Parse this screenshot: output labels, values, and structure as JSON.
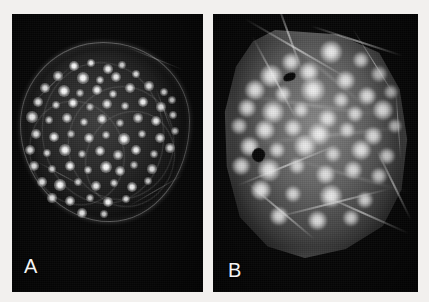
{
  "figure": {
    "kind": "fluorescence-micrograph-pair",
    "width": 429,
    "height": 302,
    "background_color": "#f2f0ee"
  },
  "panels": [
    {
      "id": "a",
      "label": "A",
      "label_color": "#f4f4f4",
      "background_color": "#070707",
      "description": "Dark-field fluorescence micrograph of a rounded cell showing numerous small, sharply defined bright punctate foci distributed across a faintly outlined circular cell body.",
      "cell_shape": "round",
      "focus_style": "small sharp puncta",
      "spot_count": 74,
      "spots": [
        {
          "x": 62,
          "y": 52,
          "r": 2.6,
          "i": 1.0
        },
        {
          "x": 79,
          "y": 49,
          "r": 2.2,
          "i": 0.92
        },
        {
          "x": 96,
          "y": 55,
          "r": 2.4,
          "i": 0.95
        },
        {
          "x": 110,
          "y": 51,
          "r": 2.0,
          "i": 0.8
        },
        {
          "x": 46,
          "y": 62,
          "r": 2.3,
          "i": 0.88
        },
        {
          "x": 71,
          "y": 64,
          "r": 2.8,
          "i": 1.0
        },
        {
          "x": 88,
          "y": 66,
          "r": 2.1,
          "i": 0.84
        },
        {
          "x": 104,
          "y": 63,
          "r": 2.5,
          "i": 0.93
        },
        {
          "x": 124,
          "y": 60,
          "r": 2.2,
          "i": 0.86
        },
        {
          "x": 33,
          "y": 74,
          "r": 2.4,
          "i": 0.9
        },
        {
          "x": 52,
          "y": 77,
          "r": 3.0,
          "i": 1.0
        },
        {
          "x": 68,
          "y": 79,
          "r": 2.0,
          "i": 0.78
        },
        {
          "x": 85,
          "y": 76,
          "r": 2.6,
          "i": 0.96
        },
        {
          "x": 101,
          "y": 80,
          "r": 2.2,
          "i": 0.85
        },
        {
          "x": 118,
          "y": 74,
          "r": 2.4,
          "i": 0.9
        },
        {
          "x": 137,
          "y": 72,
          "r": 2.3,
          "i": 0.88
        },
        {
          "x": 152,
          "y": 78,
          "r": 2.1,
          "i": 0.8
        },
        {
          "x": 26,
          "y": 88,
          "r": 2.5,
          "i": 0.92
        },
        {
          "x": 44,
          "y": 91,
          "r": 2.2,
          "i": 0.84
        },
        {
          "x": 61,
          "y": 89,
          "r": 2.7,
          "i": 0.98
        },
        {
          "x": 78,
          "y": 93,
          "r": 2.0,
          "i": 0.76
        },
        {
          "x": 95,
          "y": 90,
          "r": 2.4,
          "i": 0.9
        },
        {
          "x": 113,
          "y": 92,
          "r": 2.2,
          "i": 0.83
        },
        {
          "x": 131,
          "y": 88,
          "r": 2.6,
          "i": 0.95
        },
        {
          "x": 149,
          "y": 93,
          "r": 2.3,
          "i": 0.86
        },
        {
          "x": 160,
          "y": 86,
          "r": 2.0,
          "i": 0.78
        },
        {
          "x": 20,
          "y": 103,
          "r": 2.8,
          "i": 1.0
        },
        {
          "x": 37,
          "y": 106,
          "r": 2.1,
          "i": 0.8
        },
        {
          "x": 55,
          "y": 104,
          "r": 2.4,
          "i": 0.9
        },
        {
          "x": 72,
          "y": 108,
          "r": 2.2,
          "i": 0.84
        },
        {
          "x": 90,
          "y": 105,
          "r": 2.6,
          "i": 0.94
        },
        {
          "x": 108,
          "y": 109,
          "r": 2.0,
          "i": 0.77
        },
        {
          "x": 126,
          "y": 104,
          "r": 2.3,
          "i": 0.88
        },
        {
          "x": 144,
          "y": 107,
          "r": 2.5,
          "i": 0.92
        },
        {
          "x": 161,
          "y": 101,
          "r": 2.2,
          "i": 0.82
        },
        {
          "x": 24,
          "y": 120,
          "r": 2.4,
          "i": 0.9
        },
        {
          "x": 42,
          "y": 123,
          "r": 2.7,
          "i": 0.97
        },
        {
          "x": 59,
          "y": 120,
          "r": 2.0,
          "i": 0.76
        },
        {
          "x": 77,
          "y": 124,
          "r": 2.5,
          "i": 0.92
        },
        {
          "x": 94,
          "y": 121,
          "r": 2.2,
          "i": 0.84
        },
        {
          "x": 112,
          "y": 125,
          "r": 2.8,
          "i": 1.0
        },
        {
          "x": 130,
          "y": 120,
          "r": 2.1,
          "i": 0.8
        },
        {
          "x": 148,
          "y": 124,
          "r": 2.4,
          "i": 0.89
        },
        {
          "x": 163,
          "y": 117,
          "r": 2.0,
          "i": 0.75
        },
        {
          "x": 18,
          "y": 136,
          "r": 2.6,
          "i": 0.95
        },
        {
          "x": 35,
          "y": 139,
          "r": 2.2,
          "i": 0.83
        },
        {
          "x": 53,
          "y": 136,
          "r": 2.9,
          "i": 1.0
        },
        {
          "x": 70,
          "y": 140,
          "r": 2.1,
          "i": 0.79
        },
        {
          "x": 88,
          "y": 137,
          "r": 2.5,
          "i": 0.92
        },
        {
          "x": 106,
          "y": 141,
          "r": 2.3,
          "i": 0.86
        },
        {
          "x": 124,
          "y": 136,
          "r": 2.6,
          "i": 0.95
        },
        {
          "x": 142,
          "y": 140,
          "r": 2.0,
          "i": 0.77
        },
        {
          "x": 158,
          "y": 134,
          "r": 2.3,
          "i": 0.87
        },
        {
          "x": 22,
          "y": 152,
          "r": 2.5,
          "i": 0.93
        },
        {
          "x": 40,
          "y": 155,
          "r": 2.1,
          "i": 0.8
        },
        {
          "x": 58,
          "y": 152,
          "r": 2.7,
          "i": 0.98
        },
        {
          "x": 76,
          "y": 156,
          "r": 2.2,
          "i": 0.84
        },
        {
          "x": 94,
          "y": 153,
          "r": 3.0,
          "i": 1.0
        },
        {
          "x": 108,
          "y": 157,
          "r": 2.4,
          "i": 0.9
        },
        {
          "x": 122,
          "y": 151,
          "r": 2.0,
          "i": 0.76
        },
        {
          "x": 140,
          "y": 155,
          "r": 2.3,
          "i": 0.87
        },
        {
          "x": 30,
          "y": 168,
          "r": 2.4,
          "i": 0.9
        },
        {
          "x": 48,
          "y": 171,
          "r": 2.8,
          "i": 1.0
        },
        {
          "x": 66,
          "y": 168,
          "r": 2.1,
          "i": 0.8
        },
        {
          "x": 84,
          "y": 172,
          "r": 2.5,
          "i": 0.92
        },
        {
          "x": 102,
          "y": 169,
          "r": 2.2,
          "i": 0.83
        },
        {
          "x": 120,
          "y": 173,
          "r": 2.6,
          "i": 0.95
        },
        {
          "x": 136,
          "y": 167,
          "r": 2.0,
          "i": 0.76
        },
        {
          "x": 40,
          "y": 184,
          "r": 2.3,
          "i": 0.87
        },
        {
          "x": 58,
          "y": 187,
          "r": 2.5,
          "i": 0.92
        },
        {
          "x": 78,
          "y": 184,
          "r": 2.1,
          "i": 0.8
        },
        {
          "x": 96,
          "y": 188,
          "r": 2.7,
          "i": 0.97
        },
        {
          "x": 114,
          "y": 185,
          "r": 2.2,
          "i": 0.84
        },
        {
          "x": 70,
          "y": 199,
          "r": 2.4,
          "i": 0.9
        },
        {
          "x": 92,
          "y": 200,
          "r": 2.0,
          "i": 0.78
        }
      ],
      "arcs": [
        {
          "x": 30,
          "y": 48,
          "w": 120,
          "h": 140,
          "rot": -8
        },
        {
          "x": 56,
          "y": 72,
          "w": 104,
          "h": 112,
          "rot": 12
        },
        {
          "x": 18,
          "y": 86,
          "w": 92,
          "h": 104,
          "rot": -20
        },
        {
          "x": 74,
          "y": 96,
          "w": 86,
          "h": 96,
          "rot": 26
        }
      ],
      "fibers": [
        {
          "x": 14,
          "y": 70,
          "w": 52,
          "h": 1.4,
          "rot": -44
        },
        {
          "x": 112,
          "y": 44,
          "w": 62,
          "h": 1.4,
          "rot": 22
        },
        {
          "x": 20,
          "y": 160,
          "w": 58,
          "h": 1.2,
          "rot": 28
        },
        {
          "x": 112,
          "y": 176,
          "w": 64,
          "h": 1.3,
          "rot": -30
        },
        {
          "x": 128,
          "y": 96,
          "w": 48,
          "h": 1.2,
          "rot": 70
        }
      ]
    },
    {
      "id": "b",
      "label": "B",
      "label_color": "#f4f4f4",
      "background_color": "#070707",
      "description": "Fluorescence micrograph of a larger, brighter and more angular cell with diffuse grey cytoplasmic signal, larger fuzzy bright foci, prominent fibrous streaks and two dark pigmented blotches.",
      "cell_shape": "angular-polygonal",
      "focus_style": "large diffuse foci with halos",
      "spot_count": 42,
      "spots": [
        {
          "x": 118,
          "y": 38,
          "r": 6.0,
          "i": 0.92
        },
        {
          "x": 148,
          "y": 46,
          "r": 4.2,
          "i": 0.78
        },
        {
          "x": 78,
          "y": 48,
          "r": 4.6,
          "i": 0.82
        },
        {
          "x": 96,
          "y": 58,
          "r": 5.4,
          "i": 0.88
        },
        {
          "x": 58,
          "y": 62,
          "r": 5.8,
          "i": 0.9
        },
        {
          "x": 132,
          "y": 66,
          "r": 5.0,
          "i": 0.85
        },
        {
          "x": 166,
          "y": 60,
          "r": 4.0,
          "i": 0.74
        },
        {
          "x": 42,
          "y": 76,
          "r": 5.2,
          "i": 0.86
        },
        {
          "x": 70,
          "y": 80,
          "r": 4.4,
          "i": 0.8
        },
        {
          "x": 100,
          "y": 76,
          "r": 6.2,
          "i": 0.94
        },
        {
          "x": 128,
          "y": 86,
          "r": 4.0,
          "i": 0.76
        },
        {
          "x": 154,
          "y": 82,
          "r": 4.8,
          "i": 0.84
        },
        {
          "x": 178,
          "y": 78,
          "r": 3.6,
          "i": 0.7
        },
        {
          "x": 34,
          "y": 94,
          "r": 4.6,
          "i": 0.82
        },
        {
          "x": 60,
          "y": 98,
          "r": 5.6,
          "i": 0.9
        },
        {
          "x": 88,
          "y": 96,
          "r": 4.2,
          "i": 0.78
        },
        {
          "x": 114,
          "y": 104,
          "r": 5.0,
          "i": 0.86
        },
        {
          "x": 142,
          "y": 100,
          "r": 4.4,
          "i": 0.8
        },
        {
          "x": 170,
          "y": 96,
          "r": 5.2,
          "i": 0.87
        },
        {
          "x": 26,
          "y": 112,
          "r": 4.0,
          "i": 0.75
        },
        {
          "x": 52,
          "y": 116,
          "r": 5.4,
          "i": 0.88
        },
        {
          "x": 80,
          "y": 114,
          "r": 4.8,
          "i": 0.83
        },
        {
          "x": 106,
          "y": 120,
          "r": 6.0,
          "i": 0.93
        },
        {
          "x": 134,
          "y": 116,
          "r": 4.2,
          "i": 0.78
        },
        {
          "x": 160,
          "y": 122,
          "r": 4.6,
          "i": 0.82
        },
        {
          "x": 182,
          "y": 112,
          "r": 3.8,
          "i": 0.72
        },
        {
          "x": 36,
          "y": 132,
          "r": 5.0,
          "i": 0.85
        },
        {
          "x": 64,
          "y": 136,
          "r": 4.4,
          "i": 0.8
        },
        {
          "x": 92,
          "y": 132,
          "r": 5.8,
          "i": 0.91
        },
        {
          "x": 120,
          "y": 140,
          "r": 4.0,
          "i": 0.76
        },
        {
          "x": 148,
          "y": 136,
          "r": 5.2,
          "i": 0.87
        },
        {
          "x": 174,
          "y": 142,
          "r": 4.2,
          "i": 0.78
        },
        {
          "x": 28,
          "y": 152,
          "r": 4.8,
          "i": 0.83
        },
        {
          "x": 56,
          "y": 156,
          "r": 5.6,
          "i": 0.9
        },
        {
          "x": 84,
          "y": 152,
          "r": 4.2,
          "i": 0.78
        },
        {
          "x": 112,
          "y": 160,
          "r": 5.0,
          "i": 0.85
        },
        {
          "x": 140,
          "y": 156,
          "r": 4.6,
          "i": 0.81
        },
        {
          "x": 166,
          "y": 162,
          "r": 4.0,
          "i": 0.75
        },
        {
          "x": 48,
          "y": 176,
          "r": 5.4,
          "i": 0.88
        },
        {
          "x": 80,
          "y": 180,
          "r": 4.4,
          "i": 0.8
        },
        {
          "x": 118,
          "y": 182,
          "r": 5.8,
          "i": 0.91
        },
        {
          "x": 152,
          "y": 186,
          "r": 4.2,
          "i": 0.78
        },
        {
          "x": 66,
          "y": 202,
          "r": 4.6,
          "i": 0.82
        },
        {
          "x": 104,
          "y": 206,
          "r": 5.0,
          "i": 0.85
        },
        {
          "x": 138,
          "y": 204,
          "r": 4.0,
          "i": 0.75
        }
      ],
      "dark_blotches": [
        {
          "x": 70,
          "y": 59,
          "w": 13,
          "h": 8,
          "rot": -22
        },
        {
          "x": 39,
          "y": 134,
          "w": 13,
          "h": 14,
          "rot": 14
        }
      ],
      "fibers": [
        {
          "x": 24,
          "y": 34,
          "w": 120,
          "h": 2.0,
          "rot": 30
        },
        {
          "x": 14,
          "y": 64,
          "w": 96,
          "h": 1.8,
          "rot": 62
        },
        {
          "x": 36,
          "y": 20,
          "w": 80,
          "h": 1.6,
          "rot": 70
        },
        {
          "x": 96,
          "y": 26,
          "w": 96,
          "h": 1.6,
          "rot": 18
        },
        {
          "x": 120,
          "y": 50,
          "w": 84,
          "h": 1.4,
          "rot": 58
        },
        {
          "x": 20,
          "y": 150,
          "w": 110,
          "h": 1.8,
          "rot": -22
        },
        {
          "x": 60,
          "y": 188,
          "w": 120,
          "h": 2.0,
          "rot": -14
        },
        {
          "x": 100,
          "y": 198,
          "w": 100,
          "h": 1.8,
          "rot": 24
        },
        {
          "x": 24,
          "y": 196,
          "w": 88,
          "h": 1.6,
          "rot": 40
        },
        {
          "x": 142,
          "y": 170,
          "w": 78,
          "h": 1.6,
          "rot": 64
        },
        {
          "x": 150,
          "y": 110,
          "w": 70,
          "h": 1.4,
          "rot": 86
        }
      ],
      "dim_fibers": [
        {
          "x": 30,
          "y": 90,
          "w": 140,
          "h": 2.6,
          "rot": 8
        },
        {
          "x": 40,
          "y": 120,
          "w": 150,
          "h": 2.6,
          "rot": -6
        },
        {
          "x": 50,
          "y": 60,
          "w": 130,
          "h": 2.4,
          "rot": 40
        },
        {
          "x": 70,
          "y": 160,
          "w": 130,
          "h": 2.4,
          "rot": 16
        }
      ]
    }
  ]
}
